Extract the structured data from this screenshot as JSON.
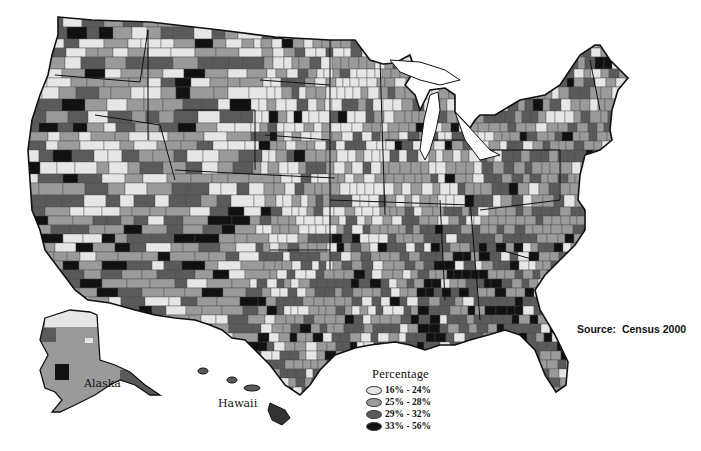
{
  "chart_data": {
    "type": "heatmap",
    "subtype": "choropleth-map",
    "title": "",
    "geography": "United States counties",
    "legend": {
      "title": "Percentage",
      "position": "bottom-center",
      "bins": [
        {
          "label": "16% - 24%",
          "min": 16,
          "max": 24,
          "color": "#e6e6e6"
        },
        {
          "label": "25% - 28%",
          "min": 25,
          "max": 28,
          "color": "#9a9a9a"
        },
        {
          "label": "29% - 32%",
          "min": 29,
          "max": 32,
          "color": "#5a5a5a"
        },
        {
          "label": "33% - 56%",
          "min": 33,
          "max": 56,
          "color": "#111111"
        }
      ]
    },
    "annotations": [
      "Alaska",
      "Hawaii",
      "Source:  Census 2000"
    ],
    "source": "Census 2000",
    "regional_pattern": {
      "Upper Midwest / Great Plains (IA, MN, WI, KS, NE)": "mostly 16% - 24%",
      "Deep South (MS, AL, GA, LA, AR)": "many 33% - 56%",
      "Mountain West": "mixed 16% - 32%",
      "Northeast": "mostly 25% - 28%",
      "Alaska": "mostly 25% - 28%, north 16% - 24%",
      "Hawaii": "29% - 32%"
    }
  },
  "labels": {
    "alaska": "Alaska",
    "hawaii": "Hawaii",
    "source": "Source:  Census 2000"
  },
  "legend": {
    "title": "Percentage",
    "items": [
      {
        "label": "16% - 24%",
        "color": "#e6e6e6"
      },
      {
        "label": "25% - 28%",
        "color": "#9a9a9a"
      },
      {
        "label": "29% - 32%",
        "color": "#5a5a5a"
      },
      {
        "label": "33% - 56%",
        "color": "#111111"
      }
    ]
  }
}
